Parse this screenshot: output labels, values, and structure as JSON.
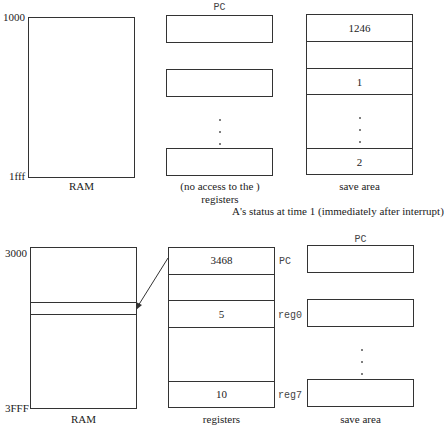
{
  "top": {
    "ram": {
      "addr_start": "1000",
      "addr_end": "1fff",
      "label": "RAM"
    },
    "registers": {
      "top_label": "PC",
      "label_line1": "(no access to the )",
      "label_line2": "registers"
    },
    "save_area": {
      "cells": [
        "1246",
        "",
        "1",
        "",
        "2"
      ],
      "label": "save area"
    },
    "caption": "A's status at time 1 (immediately after interrupt)"
  },
  "bottom": {
    "ram": {
      "addr_start": "3000",
      "addr_end": "3FFF",
      "label": "RAM"
    },
    "registers": {
      "cells": [
        "3468",
        "",
        "5",
        "",
        "10"
      ],
      "side_labels": {
        "pc": "PC",
        "reg0": "reg0",
        "reg7": "reg7"
      },
      "label": "registers"
    },
    "save_area": {
      "top_label": "PC",
      "label": "save area"
    }
  }
}
